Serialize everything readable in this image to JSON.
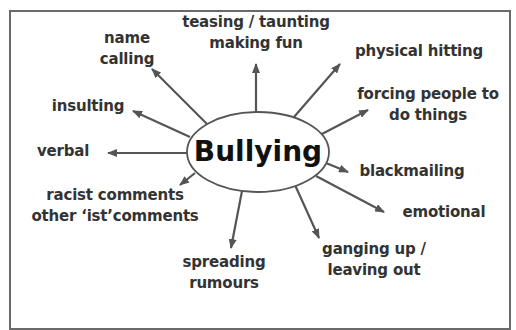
{
  "diagram": {
    "center": "Bullying",
    "branches": [
      {
        "line1": "name",
        "line2": "calling"
      },
      {
        "line1": "teasing / taunting",
        "line2": "making fun"
      },
      {
        "line1": "physical hitting"
      },
      {
        "line1": "forcing people to",
        "line2": "do things"
      },
      {
        "line1": "insulting"
      },
      {
        "line1": "verbal"
      },
      {
        "line1": "blackmailing"
      },
      {
        "line1": "racist comments",
        "line2": "other ‘ist’comments"
      },
      {
        "line1": "emotional"
      },
      {
        "line1": "spreading",
        "line2": "rumours"
      },
      {
        "line1": "ganging up /",
        "line2": "leaving out"
      }
    ],
    "colors": {
      "arrow": "#555555",
      "text": "#333333",
      "frame": "#6a6a6a"
    }
  }
}
